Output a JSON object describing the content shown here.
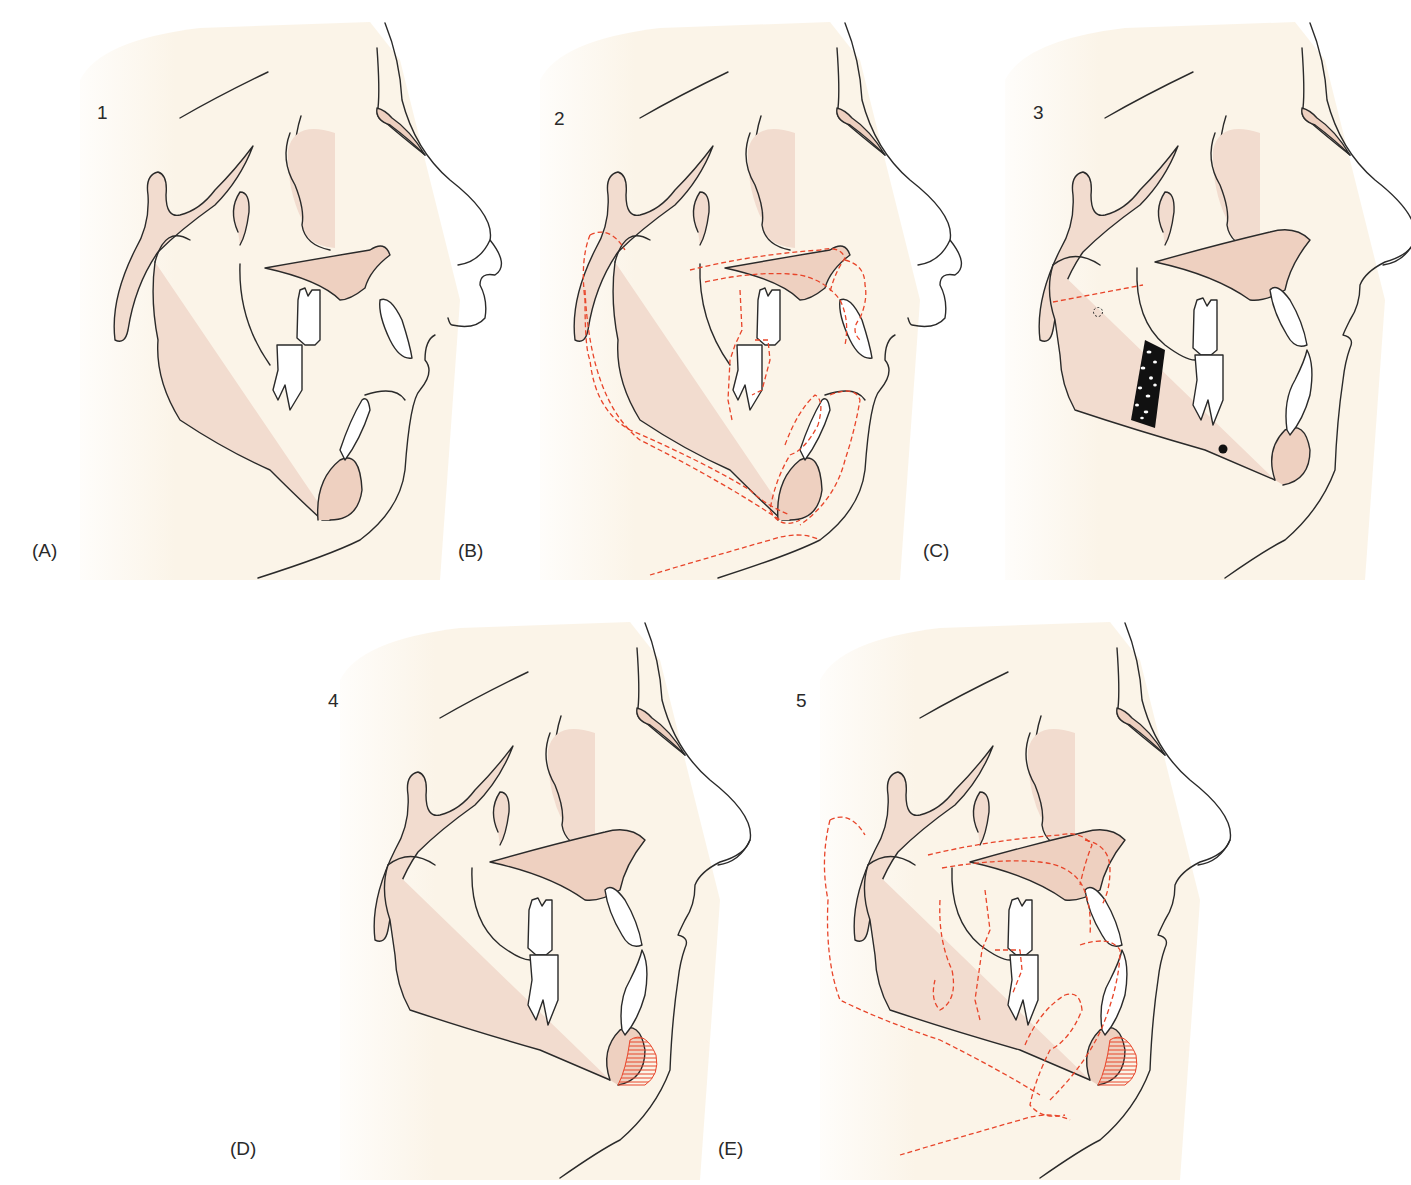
{
  "figure": {
    "colors": {
      "background": "#ffffff",
      "skin_wash": "#fbf4e8",
      "bone_fill": "#f2dccf",
      "dark_bone_fill": "#eed0c0",
      "outline": "#2a2a2a",
      "overlay_dashed": "#e8452a",
      "tooth_fill": "#ffffff",
      "graft_fill": "#111111",
      "hatch": "#e8452a"
    },
    "panels": [
      {
        "letter": "(A)",
        "number": "1",
        "overlay": false,
        "graft": false,
        "chin_hatch": false,
        "description": "initial profile, retrognathic mandible"
      },
      {
        "letter": "(B)",
        "number": "2",
        "overlay": true,
        "graft": false,
        "chin_hatch": false,
        "description": "superimposition with planned outline (dashed)"
      },
      {
        "letter": "(C)",
        "number": "3",
        "overlay": false,
        "graft": true,
        "chin_hatch": false,
        "description": "osteotomy line, bone graft block and markers"
      },
      {
        "letter": "(D)",
        "number": "4",
        "overlay": false,
        "graft": false,
        "chin_hatch": true,
        "description": "post-operative profile with genioplasty hatching"
      },
      {
        "letter": "(E)",
        "number": "5",
        "overlay": true,
        "graft": false,
        "chin_hatch": true,
        "description": "final superimposition"
      }
    ],
    "markers": {
      "open_circle": "condyle reference (dashed circle)",
      "filled_dot": "mandibular reference point"
    }
  },
  "caption": {
    "text": ""
  }
}
